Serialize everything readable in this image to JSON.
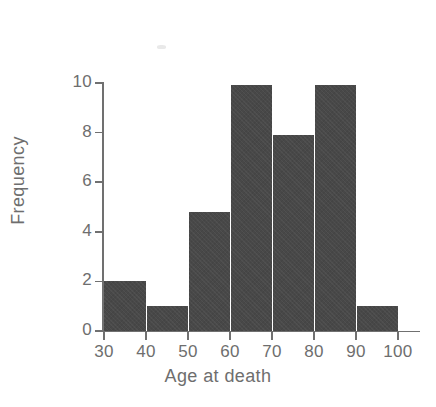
{
  "chart_data": {
    "type": "bar",
    "title": "",
    "subtitle": "",
    "xlabel": "Age at death",
    "ylabel": "Frequency",
    "categories": [
      "30-40",
      "40-50",
      "50-60",
      "60-70",
      "70-80",
      "80-90",
      "90-100"
    ],
    "bin_edges": [
      30,
      40,
      50,
      60,
      70,
      80,
      90,
      100
    ],
    "values": [
      2,
      1,
      4.8,
      9.9,
      7.9,
      9.9,
      1
    ],
    "bar_color": "#484848",
    "axis_color": "#707070",
    "background_color": "#ffffff",
    "xlim": [
      30,
      100
    ],
    "ylim": [
      0,
      10
    ],
    "xticks": [
      30,
      40,
      50,
      60,
      70,
      80,
      90,
      100
    ],
    "yticks": [
      0,
      2,
      4,
      6,
      8,
      10
    ],
    "xtick_labels": [
      "30",
      "40",
      "50",
      "60",
      "70",
      "80",
      "90",
      "100"
    ],
    "ytick_labels": [
      "0",
      "2",
      "4",
      "6",
      "8",
      "10"
    ],
    "grid": false,
    "legend": null,
    "legend_position": "none",
    "annotations": [],
    "bars": [
      {
        "label": "30-40",
        "x_start": 30,
        "x_end": 40,
        "value": 2,
        "contiguous_left": false
      },
      {
        "label": "40-50",
        "x_start": 40,
        "x_end": 50,
        "value": 1,
        "contiguous_left": true
      },
      {
        "label": "50-60",
        "x_start": 50,
        "x_end": 60,
        "value": 4.8,
        "contiguous_left": true
      },
      {
        "label": "60-70",
        "x_start": 60,
        "x_end": 70,
        "value": 9.9,
        "contiguous_left": true
      },
      {
        "label": "70-80",
        "x_start": 70,
        "x_end": 80,
        "value": 7.9,
        "contiguous_left": true
      },
      {
        "label": "80-90",
        "x_start": 80,
        "x_end": 90,
        "value": 9.9,
        "contiguous_left": true
      },
      {
        "label": "90-100",
        "x_start": 90,
        "x_end": 100,
        "value": 1,
        "contiguous_left": true
      }
    ]
  }
}
